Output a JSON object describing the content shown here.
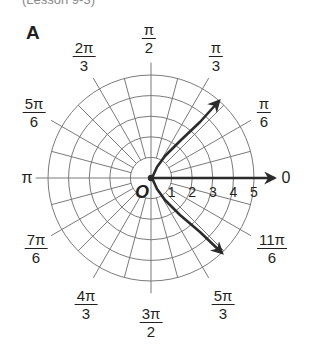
{
  "header": {
    "lesson_ref": "(Lesson 9-3)",
    "panel_letter": "A"
  },
  "chart_data": {
    "type": "polar",
    "title": "A",
    "center_px": [
      151,
      178
    ],
    "px_per_unit": 20.6,
    "radial_max": 5,
    "radial_ticks": [
      "1",
      "2",
      "3",
      "4",
      "5"
    ],
    "angle_step_deg": 15,
    "angle_labels": [
      {
        "angle": "0",
        "num": "0",
        "den": null,
        "x": 286,
        "y": 178
      },
      {
        "angle": "pi/6",
        "num": "π",
        "den": "6",
        "x": 264,
        "y": 96
      },
      {
        "angle": "pi/3",
        "num": "π",
        "den": "3",
        "x": 216,
        "y": 40
      },
      {
        "angle": "pi/2",
        "num": "π",
        "den": "2",
        "x": 149,
        "y": 22
      },
      {
        "angle": "2pi/3",
        "num": "2π",
        "den": "3",
        "x": 84,
        "y": 40
      },
      {
        "angle": "5pi/6",
        "num": "5π",
        "den": "6",
        "x": 34,
        "y": 96
      },
      {
        "angle": "pi",
        "num": "π",
        "den": null,
        "x": 27,
        "y": 178
      },
      {
        "angle": "7pi/6",
        "num": "7π",
        "den": "6",
        "x": 36,
        "y": 232
      },
      {
        "angle": "4pi/3",
        "num": "4π",
        "den": "3",
        "x": 86,
        "y": 288
      },
      {
        "angle": "3pi/2",
        "num": "3π",
        "den": "2",
        "x": 151,
        "y": 306
      },
      {
        "angle": "5pi/3",
        "num": "5π",
        "den": "3",
        "x": 223,
        "y": 288
      },
      {
        "angle": "11pi/6",
        "num": "11π",
        "den": "6",
        "x": 272,
        "y": 232
      }
    ],
    "origin_label": "O",
    "series": [
      {
        "name": "polar axis ray",
        "type": "ray",
        "from": [
          0,
          0
        ],
        "to_r": 6.0,
        "theta": 0,
        "arrow": true
      },
      {
        "name": "curve",
        "type": "curve",
        "points_px": [
          [
            222,
            253
          ],
          [
            200,
            232
          ],
          [
            180,
            215
          ],
          [
            165,
            200
          ],
          [
            157,
            189
          ],
          [
            152,
            178
          ],
          [
            157,
            167
          ],
          [
            165,
            156
          ],
          [
            180,
            141
          ],
          [
            200,
            122
          ],
          [
            219,
            101
          ]
        ],
        "arrow_both_ends": true
      }
    ],
    "colors": {
      "grid": "#7a7a7a",
      "curve": "#2b2b2b",
      "text": "#231f20"
    },
    "grid": true
  }
}
